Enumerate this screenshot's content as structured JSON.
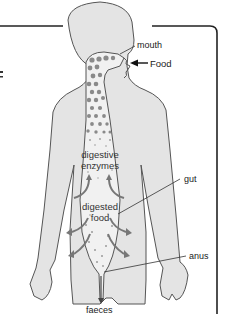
{
  "diagram": {
    "labels": {
      "mouth": "mouth",
      "food": "Food",
      "digestive_enzymes_line1": "digestive",
      "digestive_enzymes_line2": "enzymes",
      "digested_food_line1": "digested",
      "digested_food_line2": "food",
      "gut": "gut",
      "anus": "anus",
      "faeces": "faeces"
    },
    "colors": {
      "body_fill": "#e4e4e4",
      "outline": "#555555",
      "gut_fill": "#f1f1f1",
      "food_particles": "#8a8a8a",
      "absorb_arrows": "#777777",
      "frame": "#222222"
    }
  }
}
